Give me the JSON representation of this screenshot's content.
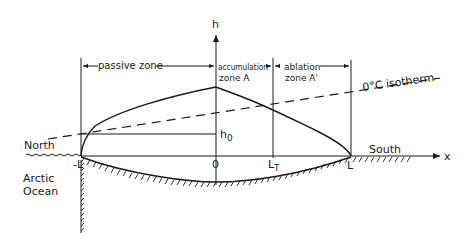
{
  "diagram": {
    "axes": {
      "vertical_label": "h",
      "horizontal_label": "x"
    },
    "zones": {
      "passive": "passive zone",
      "accumulation_line1": "accumulation",
      "accumulation_line2": "zone A",
      "ablation_line1": "ablation",
      "ablation_line2": "zone A'"
    },
    "isotherm_label": "0°C isotherm",
    "reference_height_label": "h",
    "reference_height_sub": "0",
    "tick_labels": {
      "neg_L": "-L",
      "origin": "0",
      "LT_main": "L",
      "LT_sub": "T",
      "L": "L"
    },
    "geography": {
      "north": "North",
      "south": "South",
      "ocean_line1": "Arctic",
      "ocean_line2": "Ocean"
    },
    "colors": {
      "ink": "#1a1a1a",
      "background": "#ffffff"
    }
  }
}
